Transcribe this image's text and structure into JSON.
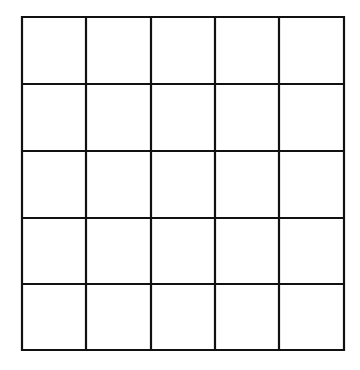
{
  "grid": {
    "rows": 5,
    "cols": 5,
    "x_lines": [
      22,
      86,
      151,
      215,
      279,
      344
    ],
    "y_lines": [
      17,
      84,
      151,
      218,
      284,
      350
    ],
    "line_color": "#111111",
    "line_width": 2.2,
    "background": "#ffffff",
    "cells": [
      [
        "",
        "",
        "",
        "",
        ""
      ],
      [
        "",
        "",
        "",
        "",
        ""
      ],
      [
        "",
        "",
        "",
        "",
        ""
      ],
      [
        "",
        "",
        "",
        "",
        ""
      ],
      [
        "",
        "",
        "",
        "",
        ""
      ]
    ]
  }
}
